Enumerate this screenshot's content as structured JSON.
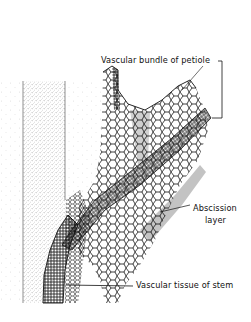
{
  "figure": {
    "labels": {
      "petiole_bundle": "Vascular bundle of petiole",
      "abscission_line1": "Abscission",
      "abscission_line2": "layer",
      "stem_tissue": "Vascular tissue of stem"
    },
    "colors": {
      "ink": "#111111",
      "stipple": "#555555",
      "background": "#ffffff"
    }
  }
}
